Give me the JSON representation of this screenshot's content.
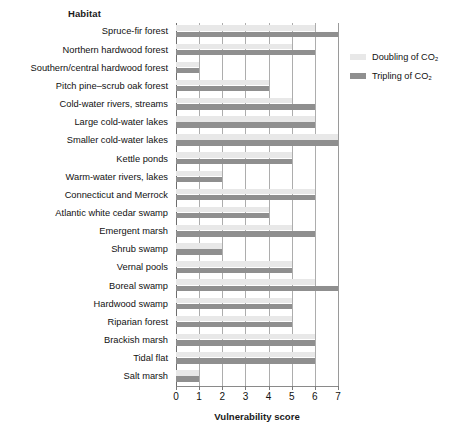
{
  "chart_data": {
    "type": "bar",
    "orientation": "horizontal",
    "title": "",
    "column_header": "Habitat",
    "xlabel": "Vulnerability score",
    "ylabel": "",
    "xlim": [
      0,
      7
    ],
    "xticks": [
      0,
      1,
      2,
      3,
      4,
      5,
      6,
      7
    ],
    "grid": "vertical",
    "legend_position": "right-top",
    "categories": [
      "Spruce-fir forest",
      "Northern hardwood forest",
      "Southern/central hardwood forest",
      "Pitch pine–scrub oak forest",
      "Cold-water rivers, streams",
      "Large cold-water lakes",
      "Smaller cold-water lakes",
      "Kettle ponds",
      "Warm-water rivers, lakes",
      "Connecticut and Merrock",
      "Atlantic white cedar swamp",
      "Emergent marsh",
      "Shrub swamp",
      "Vernal pools",
      "Boreal swamp",
      "Hardwood swamp",
      "Riparian forest",
      "Brackish marsh",
      "Tidal flat",
      "Salt marsh"
    ],
    "series": [
      {
        "name": "Doubling of CO₂",
        "color": "#e8e8e8",
        "values": [
          6,
          5,
          1,
          4,
          5,
          6,
          7,
          5,
          2,
          6,
          4,
          5,
          2,
          5,
          6,
          5,
          5,
          6,
          6,
          1
        ]
      },
      {
        "name": "Tripling of CO₂",
        "color": "#8f8f8f",
        "values": [
          7,
          6,
          1,
          4,
          6,
          6,
          7,
          5,
          2,
          6,
          4,
          6,
          2,
          5,
          7,
          5,
          5,
          6,
          6,
          1
        ]
      }
    ]
  },
  "legend": {
    "items": [
      {
        "label": "Doubling of CO₂",
        "color": "#e8e8e8"
      },
      {
        "label": "Tripling of CO₂",
        "color": "#8f8f8f"
      }
    ]
  },
  "axis": {
    "x_tick_labels": [
      "0",
      "1",
      "2",
      "3",
      "4",
      "5",
      "6",
      "7"
    ],
    "x_title": "Vulnerability score"
  },
  "header": {
    "habitat": "Habitat"
  }
}
